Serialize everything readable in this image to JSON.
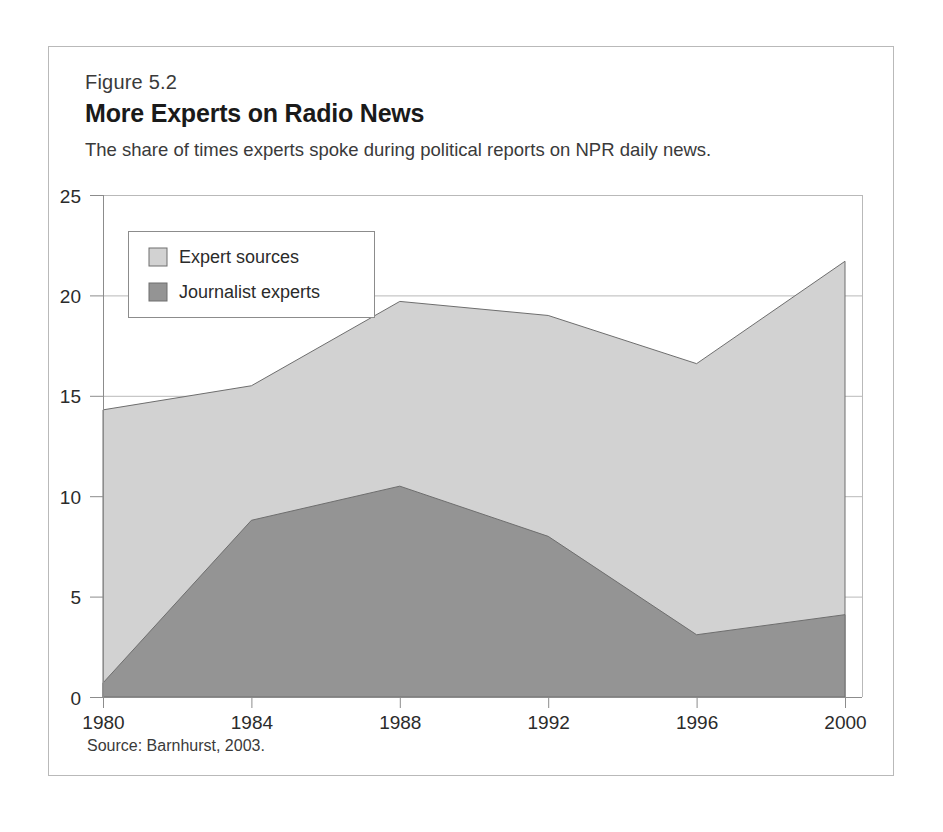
{
  "figure": {
    "number": "Figure 5.2",
    "title": "More Experts on Radio News",
    "subtitle": "The share of times experts spoke during political reports on NPR daily news.",
    "source": "Source: Barnhurst, 2003."
  },
  "colors": {
    "expert_sources": "#d2d2d2",
    "journalist_experts": "#949494",
    "series_outline": "#6e6e6e",
    "grid": "#b9b9b9",
    "axis": "#8c8c8c",
    "frame": "#b9b9b9",
    "text": "#2b2b2b"
  },
  "axis": {
    "y_ticks": [
      "0",
      "5",
      "10",
      "15",
      "20",
      "25"
    ],
    "x_ticks": [
      "1980",
      "1984",
      "1988",
      "1992",
      "1996",
      "2000"
    ]
  },
  "legend": {
    "items": [
      {
        "label": "Expert sources",
        "swatch": "#d2d2d2"
      },
      {
        "label": "Journalist experts",
        "swatch": "#949494"
      }
    ]
  },
  "chart_data": {
    "type": "area",
    "stacked": false,
    "title": "More Experts on Radio News",
    "subtitle": "The share of times experts spoke during political reports on NPR daily news.",
    "xlabel": "",
    "ylabel": "",
    "xlim": [
      1980,
      2000
    ],
    "ylim": [
      0,
      25
    ],
    "yticks": [
      0,
      5,
      10,
      15,
      20,
      25
    ],
    "xticks": [
      1980,
      1984,
      1988,
      1992,
      1996,
      2000
    ],
    "grid": "horizontal",
    "legend_position": "upper-left-inset",
    "x": [
      1980,
      1984,
      1988,
      1992,
      1996,
      2000
    ],
    "series": [
      {
        "name": "Expert sources",
        "color": "#d2d2d2",
        "values": [
          14.3,
          15.5,
          19.7,
          19.0,
          16.6,
          21.7
        ]
      },
      {
        "name": "Journalist experts",
        "color": "#949494",
        "values": [
          0.7,
          8.8,
          10.5,
          8.0,
          3.1,
          4.1
        ]
      }
    ],
    "source": "Source: Barnhurst, 2003."
  }
}
